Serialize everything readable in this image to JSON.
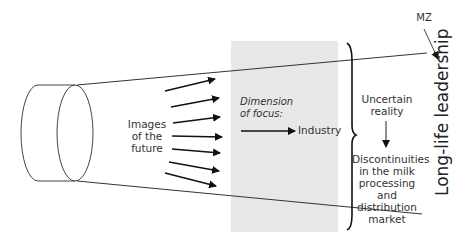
{
  "diagram": {
    "labels": {
      "images_of_future": [
        "Images",
        "of the",
        "future"
      ],
      "dimension_of_focus": [
        "Dimension",
        "of focus:"
      ],
      "industry": "Industry",
      "uncertain_reality": [
        "Uncertain",
        "reality"
      ],
      "discontinuities": [
        "Discontinuities",
        "in the milk",
        "processing and",
        "distribution",
        "market"
      ],
      "long_life_leadership": "Long-life leadership",
      "mz": "MZ"
    },
    "colors": {
      "focus_band": "#e8e8e8",
      "line": "#222222"
    },
    "arrow_count": 7
  }
}
